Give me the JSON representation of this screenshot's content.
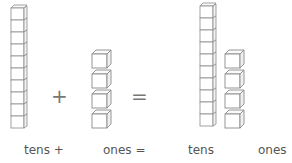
{
  "diagram": {
    "left": {
      "tens_rods": 1,
      "rod_units": 10,
      "ones_cubes": 4
    },
    "right": {
      "tens_rods": 1,
      "rod_units": 10,
      "ones_cubes": 4
    },
    "operators": {
      "plus": "+",
      "equals": "="
    },
    "labels": {
      "tens_plus": "tens +",
      "ones_equals": "ones =",
      "tens": "tens",
      "ones": "ones"
    },
    "colors": {
      "stroke": "#8a8a8a",
      "fill": "#ffffff",
      "text": "#555555"
    }
  }
}
